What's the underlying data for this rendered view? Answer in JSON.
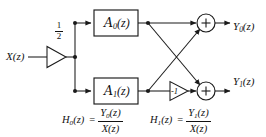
{
  "figure": {
    "type": "signal-flow-block-diagram",
    "background_color": "#ffffff",
    "line_color": "#1a1a1a",
    "text_color": "#111111"
  },
  "input": {
    "label": "X(z)",
    "base": "X",
    "arg": "(z)"
  },
  "gain_half": {
    "numerator": "1",
    "denominator": "2",
    "value": "1/2",
    "shape": "triangle-amplifier"
  },
  "blocks": [
    {
      "name": "allpass-a0",
      "script": "A",
      "subscript": "0",
      "arg": "(z)",
      "label": "A0(z)"
    },
    {
      "name": "allpass-a1",
      "script": "A",
      "subscript": "1",
      "arg": "(z)",
      "label": "A1(z)"
    }
  ],
  "gain_neg1": {
    "label": "-1",
    "value": "-1",
    "shape": "triangle-amplifier"
  },
  "adders": [
    {
      "name": "adder-top",
      "symbol": "+"
    },
    {
      "name": "adder-bottom",
      "symbol": "+"
    }
  ],
  "outputs": [
    {
      "name": "output-y0",
      "base": "Y",
      "subscript": "0",
      "arg": "(z)",
      "label": "Y0(z)"
    },
    {
      "name": "output-y1",
      "base": "Y",
      "subscript": "1",
      "arg": "(z)",
      "label": "Y1(z)"
    }
  ],
  "equations": [
    {
      "name": "transfer-function-h0",
      "lhs_base": "H",
      "lhs_sub": "0",
      "lhs_arg": "(z)",
      "equals": "=",
      "num_base": "Y",
      "num_sub": "0",
      "num_arg": "(z)",
      "den": "X(z)",
      "full": "H0(z) = Y0(z)/X(z)"
    },
    {
      "name": "transfer-function-h1",
      "lhs_base": "H",
      "lhs_sub": "1",
      "lhs_arg": "(z)",
      "equals": "=",
      "num_base": "Y",
      "num_sub": "1",
      "num_arg": "(z)",
      "den": "X(z)",
      "full": "H1(z) = Y1(z)/X(z)"
    }
  ]
}
